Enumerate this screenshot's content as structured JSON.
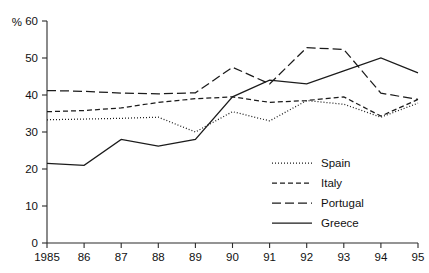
{
  "chart_data": {
    "type": "line",
    "title": "",
    "subtitle": "",
    "xlabel": "",
    "ylabel": "%",
    "unit_label": "%",
    "x": [
      1985,
      1986,
      1987,
      1988,
      1989,
      1990,
      1991,
      1992,
      1993,
      1994,
      1995
    ],
    "x_tick_labels": [
      "1985",
      "86",
      "87",
      "88",
      "89",
      "90",
      "91",
      "92",
      "93",
      "94",
      "95"
    ],
    "y_tick_labels": [
      "0",
      "10",
      "20",
      "30",
      "40",
      "50",
      "60"
    ],
    "y_ticks": [
      0,
      10,
      20,
      30,
      40,
      50,
      60
    ],
    "ylim": [
      0,
      60
    ],
    "xlim": [
      1985,
      1995
    ],
    "grid": false,
    "legend_position": "inside-right",
    "series": [
      {
        "name": "Spain",
        "dash": "dotted",
        "dasharray": "1,2",
        "values": [
          33.3,
          33.5,
          33.7,
          34.0,
          30.0,
          35.5,
          33.0,
          38.5,
          37.5,
          34.0,
          37.8
        ]
      },
      {
        "name": "Italy",
        "dash": "short-dash",
        "dasharray": "5,3",
        "values": [
          35.5,
          35.8,
          36.5,
          38.0,
          39.0,
          39.5,
          38.0,
          38.5,
          39.5,
          34.3,
          38.8
        ]
      },
      {
        "name": "Portugal",
        "dash": "long-dash",
        "dasharray": "9,4",
        "values": [
          41.2,
          41.0,
          40.5,
          40.3,
          40.6,
          47.5,
          43.0,
          52.8,
          52.3,
          40.5,
          38.8
        ]
      },
      {
        "name": "Greece",
        "dash": "solid",
        "dasharray": "0",
        "values": [
          21.5,
          21.0,
          28.0,
          26.2,
          28.0,
          39.5,
          44.0,
          43.0,
          46.5,
          50.0,
          46.0
        ]
      }
    ]
  },
  "legend": {
    "items": [
      {
        "label": "Spain"
      },
      {
        "label": "Italy"
      },
      {
        "label": "Portugal"
      },
      {
        "label": "Greece"
      }
    ]
  }
}
